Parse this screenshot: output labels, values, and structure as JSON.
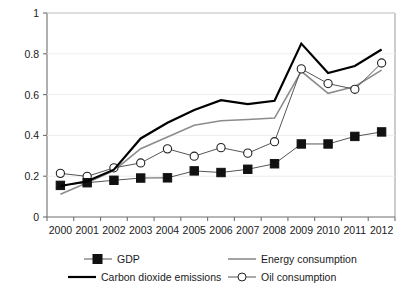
{
  "chart_data": {
    "type": "line",
    "title": "",
    "subtitle": "",
    "xlabel": "",
    "ylabel": "",
    "x": [
      "2000",
      "2001",
      "2002",
      "2003",
      "2004",
      "2005",
      "2006",
      "2007",
      "2008",
      "2009",
      "2010",
      "2011",
      "2012"
    ],
    "categories": [
      "2000",
      "2001",
      "2002",
      "2003",
      "2004",
      "2005",
      "2006",
      "2007",
      "2008",
      "2009",
      "2010",
      "2011",
      "2012"
    ],
    "xlim": [
      2000,
      2012
    ],
    "ylim": [
      0,
      1
    ],
    "yticks": [
      0,
      0.2,
      0.4,
      0.6,
      0.8,
      1
    ],
    "ytick_labels": [
      "0",
      "0.2",
      "0.4",
      "0.6",
      "0.8",
      "1"
    ],
    "xtick_labels": [
      "2000",
      "2001",
      "2002",
      "2003",
      "2004",
      "2005",
      "2006",
      "2007",
      "2008",
      "2009",
      "2010",
      "2011",
      "2012"
    ],
    "grid": true,
    "grid_axis": "y",
    "legend_position": "bottom",
    "series": [
      {
        "name": "GDP",
        "marker": "filled-square",
        "color": "#555555",
        "line_width": 1,
        "values": [
          0.155,
          0.168,
          0.18,
          0.191,
          0.192,
          0.226,
          0.218,
          0.234,
          0.261,
          0.358,
          0.358,
          0.395,
          0.417
        ]
      },
      {
        "name": "Carbon dioxide emissions",
        "marker": "none",
        "color": "#000000",
        "line_width": 2.2,
        "values": [
          0.152,
          0.175,
          0.232,
          0.385,
          0.462,
          0.525,
          0.573,
          0.553,
          0.57,
          0.85,
          0.706,
          0.74,
          0.821
        ]
      },
      {
        "name": "Energy consumption",
        "marker": "none",
        "color": "#8c8c8c",
        "line_width": 1.6,
        "values": [
          0.112,
          0.168,
          0.228,
          0.335,
          0.392,
          0.45,
          0.472,
          0.478,
          0.485,
          0.714,
          0.606,
          0.64,
          0.72
        ]
      },
      {
        "name": "Oil consumption",
        "marker": "open-circle",
        "color": "#555555",
        "line_width": 1,
        "values": [
          0.214,
          0.199,
          0.241,
          0.265,
          0.334,
          0.298,
          0.34,
          0.313,
          0.369,
          0.726,
          0.654,
          0.626,
          0.755
        ]
      }
    ]
  },
  "legend": {
    "entries": [
      {
        "label": "GDP",
        "key": "filled-square-line"
      },
      {
        "label": "Carbon dioxide emissions",
        "key": "thick-black-line"
      },
      {
        "label": "Energy consumption",
        "key": "gray-line"
      },
      {
        "label": "Oil consumption",
        "key": "open-circle-line"
      }
    ]
  },
  "colors": {
    "gdp": "#555555",
    "co2": "#000000",
    "energy": "#8c8c8c",
    "oil": "#555555",
    "axis": "#8a8a8a",
    "grid": "#ededed",
    "text": "#1a1a1a",
    "background": "#ffffff"
  }
}
